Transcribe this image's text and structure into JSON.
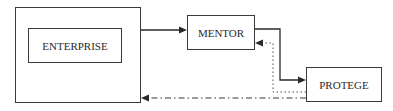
{
  "diagram": {
    "nodes": {
      "enterprise": {
        "label": "ENTERPRISE"
      },
      "mentor": {
        "label": "MENTOR"
      },
      "protege": {
        "label": "PROTEGE"
      }
    },
    "edges": [
      {
        "from": "enterprise",
        "to": "mentor",
        "style": "solid"
      },
      {
        "from": "mentor",
        "to": "protege",
        "style": "solid"
      },
      {
        "from": "protege",
        "to": "mentor",
        "style": "dotted"
      },
      {
        "from": "protege",
        "to": "enterprise",
        "style": "dash-dot"
      }
    ],
    "colors": {
      "line": "#2a2a2a",
      "background": "#ffffff"
    }
  }
}
